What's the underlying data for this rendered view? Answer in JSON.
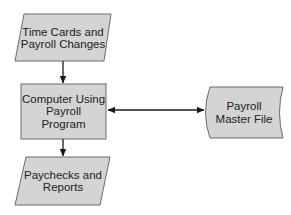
{
  "diagram": {
    "type": "flowchart",
    "colors": {
      "shape_fill": "#d4d4d4",
      "shape_stroke": "#6a6a6a",
      "arrow": "#1a1a1a",
      "text": "#222222",
      "background": "#ffffff"
    },
    "nodes": [
      {
        "id": "input",
        "shape": "parallelogram",
        "label": "Time Cards and\nPayroll Changes"
      },
      {
        "id": "process",
        "shape": "rectangle",
        "label": "Computer Using\nPayroll\nProgram"
      },
      {
        "id": "storage",
        "shape": "stored-data",
        "label": "Payroll\nMaster File"
      },
      {
        "id": "output",
        "shape": "parallelogram",
        "label": "Paychecks and\nReports"
      }
    ],
    "edges": [
      {
        "from": "input",
        "to": "process",
        "direction": "forward"
      },
      {
        "from": "process",
        "to": "storage",
        "direction": "bidirectional"
      },
      {
        "from": "process",
        "to": "output",
        "direction": "forward"
      }
    ]
  }
}
